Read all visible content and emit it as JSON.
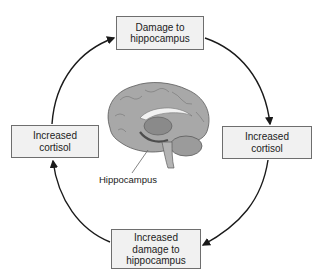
{
  "diagram": {
    "type": "cycle",
    "nodes": {
      "top": {
        "lines": [
          "Damage to",
          "hippocampus"
        ]
      },
      "right": {
        "lines": [
          "Increased",
          "cortisol"
        ]
      },
      "bottom": {
        "lines": [
          "Increased",
          "damage to",
          "hippocampus"
        ]
      },
      "left": {
        "lines": [
          "Increased",
          "cortisol"
        ]
      }
    },
    "arrows": [
      {
        "from": "top",
        "to": "right",
        "direction": "clockwise"
      },
      {
        "from": "right",
        "to": "bottom",
        "direction": "clockwise"
      },
      {
        "from": "bottom",
        "to": "left",
        "direction": "clockwise"
      },
      {
        "from": "left",
        "to": "top",
        "direction": "clockwise"
      }
    ],
    "center_image": {
      "subject": "brain-sagittal-section",
      "callout": "Hippocampus"
    },
    "colors": {
      "box_fill": "#f1f1f1",
      "box_border": "#6e6e6e",
      "arrow": "#1a1a1a",
      "brain": "#9a9a9a"
    }
  }
}
